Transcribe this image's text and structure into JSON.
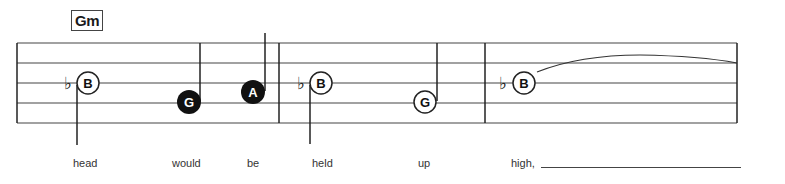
{
  "chord": {
    "label": "Gm"
  },
  "staff": {
    "lines": 5,
    "measures": 3
  },
  "notes": [
    {
      "letter": "B",
      "accidental": "♭",
      "style": "open",
      "stem": "down",
      "lyric": "head"
    },
    {
      "letter": "G",
      "accidental": "",
      "style": "filled",
      "stem": "up",
      "lyric": "would"
    },
    {
      "letter": "A",
      "accidental": "",
      "style": "filled",
      "stem": "up",
      "lyric": "be"
    },
    {
      "letter": "B",
      "accidental": "♭",
      "style": "open",
      "stem": "down",
      "lyric": "held"
    },
    {
      "letter": "G",
      "accidental": "",
      "style": "open",
      "stem": "up",
      "lyric": "up"
    },
    {
      "letter": "B",
      "accidental": "♭",
      "style": "open",
      "stem": "none",
      "tie": true,
      "lyric": "high,"
    }
  ],
  "colors": {
    "ink": "#1a1a1a",
    "paper": "#ffffff"
  }
}
